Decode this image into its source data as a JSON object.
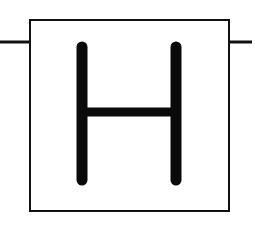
{
  "diagram": {
    "symbol": {
      "letter": "H",
      "description": "box containing the letter H with input and output wires"
    },
    "colors": {
      "stroke": "#111111",
      "background": "#ffffff"
    }
  }
}
